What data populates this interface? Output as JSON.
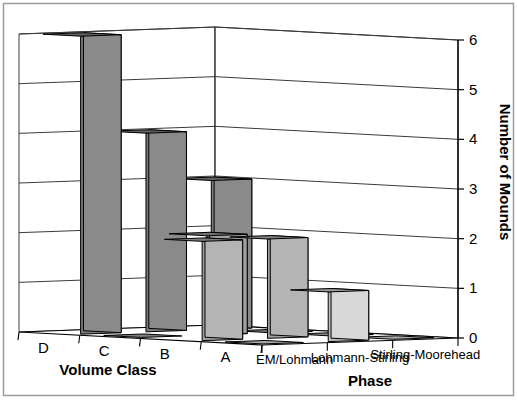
{
  "chart_data": {
    "type": "bar",
    "title": "",
    "subtitle": "",
    "xlabel": "Phase",
    "ylabel": "Number of Mounds",
    "zlabel": "Volume Class",
    "projection": "3d",
    "grid": true,
    "legend": "none",
    "ylim": [
      0,
      6
    ],
    "ytick_labels": [
      "0",
      "1",
      "2",
      "3",
      "4",
      "5",
      "6"
    ],
    "ytick_values": [
      0,
      1,
      2,
      3,
      4,
      5,
      6
    ],
    "categories": [
      "EM/Lohmann",
      "Lohmann-Stirling",
      "Stirling-Moorehead"
    ],
    "depth_categories": [
      "A",
      "B",
      "C",
      "D"
    ],
    "series": [
      {
        "name": "A",
        "values": [
          0,
          1,
          0
        ],
        "color": "#d8d8d8"
      },
      {
        "name": "B",
        "values": [
          2,
          2,
          0
        ],
        "color": "#b4b4b4"
      },
      {
        "name": "C",
        "values": [
          0,
          2,
          0
        ],
        "color": "#a0a0a0"
      },
      {
        "name": "D",
        "values": [
          6,
          4,
          3
        ],
        "color": "#8a8a8a"
      }
    ]
  },
  "axes": {
    "y_axis_title": "Number of Mounds",
    "x_axis_title": "Phase",
    "z_axis_title": "Volume Class",
    "y_ticks": [
      "6",
      "5",
      "4",
      "3",
      "2",
      "1",
      "0"
    ],
    "phase_ticks": [
      "EM/Lohmann",
      "Lohmann-Stirling",
      "Stirling-Moorehead"
    ],
    "volume_ticks": [
      "A",
      "B",
      "C",
      "D"
    ]
  },
  "colors": {
    "frame": "#9a9a9a",
    "grid": "#3a3a3a",
    "axis": "#000000",
    "background": "#ffffff",
    "bar_a": "#d8d8d8",
    "bar_b": "#b4b4b4",
    "bar_c": "#a0a0a0",
    "bar_d": "#8a8a8a"
  }
}
